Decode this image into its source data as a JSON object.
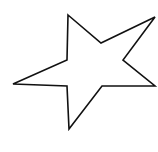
{
  "figure": {
    "shape": "star-outline",
    "points": 5,
    "stroke_color": "#111111",
    "fill_color": "#ffffff",
    "background": "#ffffff",
    "stroke_width": 1.6,
    "vertices": "68,15 101,43 155,17 123,60 155,86 102,86 69,129 67,86 13,84 67,60"
  }
}
